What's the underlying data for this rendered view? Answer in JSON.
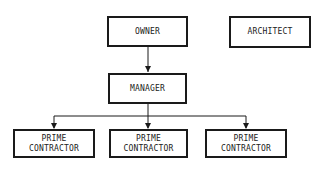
{
  "diagram": {
    "type": "organization-chart",
    "nodes": {
      "owner": {
        "label": "OWNER"
      },
      "architect": {
        "label": "ARCHITECT"
      },
      "manager": {
        "label": "MANAGER"
      },
      "contractor_1": {
        "line1": "PRIME",
        "line2": "CONTRACTOR"
      },
      "contractor_2": {
        "line1": "PRIME",
        "line2": "CONTRACTOR"
      },
      "contractor_3": {
        "line1": "PRIME",
        "line2": "CONTRACTOR"
      }
    },
    "edges": [
      {
        "from": "OWNER",
        "to": "MANAGER"
      },
      {
        "from": "MANAGER",
        "to": "PRIME CONTRACTOR (left)"
      },
      {
        "from": "MANAGER",
        "to": "PRIME CONTRACTOR (center)"
      },
      {
        "from": "MANAGER",
        "to": "PRIME CONTRACTOR (right)"
      }
    ],
    "colors": {
      "line": "#1a1a1a",
      "background": "#ffffff"
    }
  }
}
